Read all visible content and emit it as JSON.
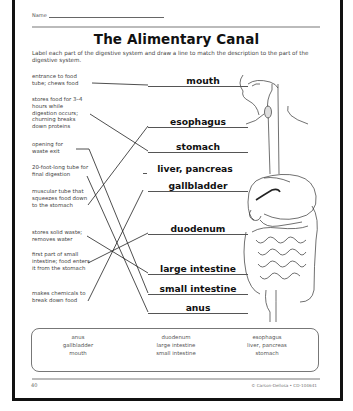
{
  "header": {
    "name_label": "Name",
    "title": "The Alimentary Canal",
    "instructions": "Label each part of the digestive system and draw a line to match the description to the part of the digestive system."
  },
  "descriptions": [
    {
      "text": "entrance to food tube; chews food",
      "top": 73
    },
    {
      "text": "stores food for 3–4 hours while digestion occurs; churning breaks down proteins",
      "top": 96
    },
    {
      "text": "opening for waste exit",
      "top": 141
    },
    {
      "text": "20-foot-long tube for final digestion",
      "top": 164
    },
    {
      "text": "muscular tube that squeezes food down to the stomach",
      "top": 188
    },
    {
      "text": "stores solid waste; removes water",
      "top": 229
    },
    {
      "text": "first part of small intestine; food enters it from the stomach",
      "top": 251
    },
    {
      "text": "makes chemicals to break down food",
      "top": 290
    }
  ],
  "labels": [
    {
      "text": "mouth",
      "top": 75,
      "left": 160,
      "width": 86
    },
    {
      "text": "esophagus",
      "top": 116,
      "left": 150,
      "width": 96
    },
    {
      "text": "stomach",
      "top": 141,
      "left": 150,
      "width": 96
    },
    {
      "text": "liver, pancreas",
      "top": 163,
      "left": 150,
      "width": 96
    },
    {
      "text": "gallbladder",
      "top": 180,
      "left": 150,
      "width": 96
    },
    {
      "text": "duodenum",
      "top": 223,
      "left": 150,
      "width": 96
    },
    {
      "text": "large intestine",
      "top": 263,
      "left": 150,
      "width": 96
    },
    {
      "text": "small intestine",
      "top": 283,
      "left": 150,
      "width": 96
    },
    {
      "text": "anus",
      "top": 302,
      "left": 150,
      "width": 96
    }
  ],
  "word_bank": {
    "columns": [
      [
        "anus",
        "gallbladder",
        "mouth"
      ],
      [
        "duodenum",
        "large intestine",
        "small intestine"
      ],
      [
        "esophagus",
        "liver, pancreas",
        "stomach"
      ]
    ]
  },
  "footer": {
    "page_number": "40",
    "copyright": "© Carson-Dellosa • CD-104641"
  }
}
